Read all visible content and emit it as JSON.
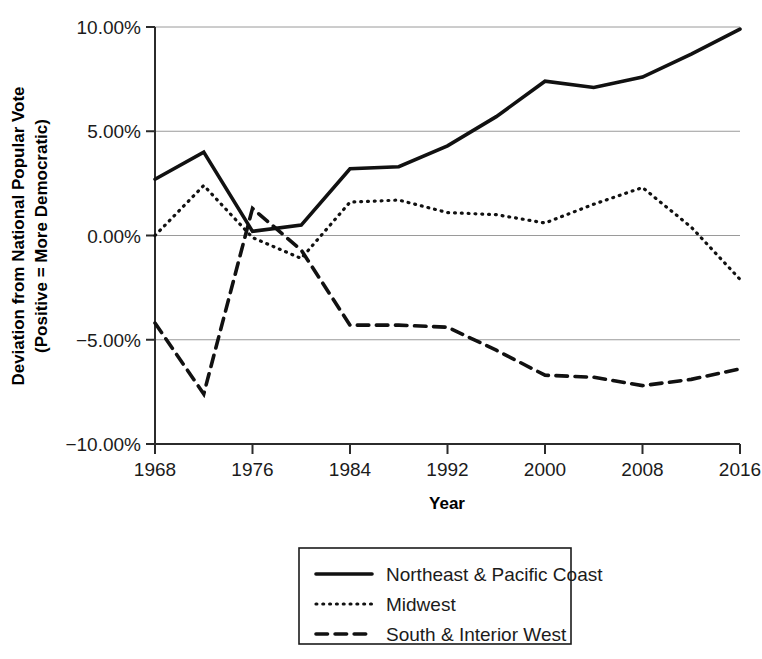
{
  "chart_data": {
    "type": "line",
    "title": "",
    "subtitle": "",
    "xlabel": "Year",
    "ylabel": "Deviation from National Popular Vote\n(Positive = More Democratic)",
    "ylabel_line1": "Deviation from National Popular Vote",
    "ylabel_line2": "(Positive = More Democratic)",
    "x": [
      1968,
      1972,
      1976,
      1980,
      1984,
      1988,
      1992,
      1996,
      2000,
      2004,
      2008,
      2012,
      2016
    ],
    "xtick_values": [
      1968,
      1976,
      1984,
      1992,
      2000,
      2008,
      2016
    ],
    "xtick_labels": [
      "1968",
      "1976",
      "1984",
      "1992",
      "2000",
      "2008",
      "2016"
    ],
    "ytick_values": [
      10,
      5,
      0,
      -5,
      -10
    ],
    "ytick_labels": [
      "10.00%",
      "5.00%",
      "0.00%",
      "−5.00%",
      "−10.00%"
    ],
    "xlim": [
      1968,
      2016
    ],
    "ylim": [
      -10,
      10
    ],
    "grid": "horizontal",
    "legend_position": "below-center",
    "series": [
      {
        "name": "Northeast & Pacific Coast",
        "style": "solid",
        "color": "#111111",
        "width": 3.6,
        "values": [
          2.7,
          4.0,
          0.2,
          0.5,
          3.2,
          3.3,
          4.3,
          5.7,
          7.4,
          7.1,
          7.6,
          8.7,
          9.9
        ]
      },
      {
        "name": "Midwest",
        "style": "dotted",
        "color": "#111111",
        "width": 3.2,
        "values": [
          0.0,
          2.4,
          -0.1,
          -1.1,
          1.6,
          1.7,
          1.1,
          1.0,
          0.6,
          1.5,
          2.3,
          0.4,
          -2.1
        ]
      },
      {
        "name": "South & Interior West",
        "style": "dashed",
        "color": "#111111",
        "width": 3.6,
        "values": [
          -4.2,
          -7.6,
          1.3,
          -0.7,
          -4.3,
          -4.3,
          -4.4,
          -5.5,
          -6.7,
          -6.8,
          -7.2,
          -6.9,
          -6.4
        ]
      }
    ]
  },
  "legend": {
    "items": [
      {
        "label": "Northeast & Pacific Coast",
        "style": "solid"
      },
      {
        "label": "Midwest",
        "style": "dotted"
      },
      {
        "label": "South & Interior West",
        "style": "dashed"
      }
    ]
  },
  "colors": {
    "ink": "#111111",
    "grid": "#9a9a9a",
    "axis": "#2b2b2b",
    "background": "#ffffff"
  }
}
